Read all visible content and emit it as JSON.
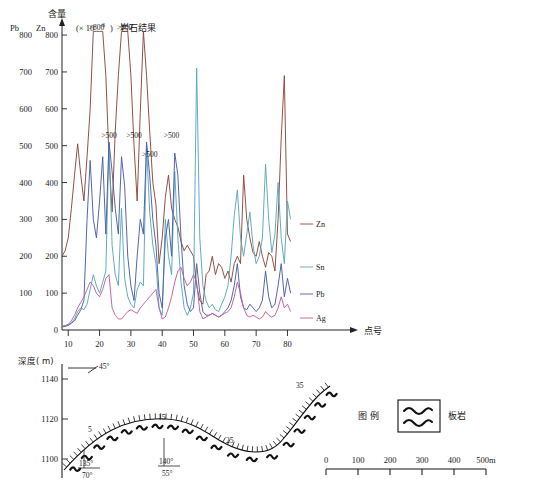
{
  "figure": {
    "top_panel": {
      "header": {
        "quantity_label": "含量",
        "unit_label": "(× 10",
        "unit_exp": "-6",
        "unit_close": ")",
        "title": "岩石结果"
      },
      "left_axis_name": "Pb",
      "right_axis_name": "Zn",
      "x_axis_label": "点号",
      "y_ticks": [
        800,
        700,
        600,
        500,
        400,
        300,
        200,
        100,
        0
      ],
      "x_ticks": [
        10,
        20,
        30,
        40,
        50,
        60,
        70,
        80
      ],
      "series_labels": [
        "Zn",
        "Sn",
        "Pb",
        "Ag"
      ],
      "annotations": [
        ">800",
        ">800",
        ">500",
        ">500",
        ">500",
        ">500"
      ],
      "colors": {
        "Zn": "#8B4A3A",
        "Sn": "#5BA8BF",
        "Pb": "#4A5FA8",
        "Ag": "#C060A0",
        "axis": "#222222"
      }
    },
    "bottom_panel": {
      "depth_axis_label": "深度( m)",
      "depth_ticks": [
        1140,
        1120,
        1100
      ],
      "dip_symbol_label": "45°",
      "station_labels": [
        "5",
        "15",
        "25",
        "35"
      ],
      "attitudes": [
        {
          "strike": "135°",
          "dip": "70°"
        },
        {
          "strike": "140°",
          "dip": "55°"
        }
      ],
      "legend": {
        "title": "图  例",
        "symbol_name": "wave-symbol",
        "item_label": "板岩"
      },
      "scalebar": {
        "ticks": [
          "0",
          "100",
          "200",
          "300",
          "400",
          "500m"
        ]
      }
    }
  },
  "chart_data": {
    "type": "line",
    "title": "岩石结果",
    "xlabel": "点号",
    "ylabel": "含量 (× 10-6)",
    "xlim": [
      8,
      84
    ],
    "ylim": [
      0,
      830
    ],
    "grid": false,
    "legend_position": "right",
    "x": [
      8,
      9,
      10,
      11,
      12,
      13,
      14,
      15,
      16,
      17,
      18,
      19,
      20,
      21,
      22,
      23,
      24,
      25,
      26,
      27,
      28,
      29,
      30,
      31,
      32,
      33,
      34,
      35,
      36,
      37,
      38,
      39,
      40,
      41,
      42,
      43,
      44,
      45,
      46,
      47,
      48,
      49,
      50,
      51,
      52,
      53,
      54,
      55,
      56,
      57,
      58,
      59,
      60,
      61,
      62,
      63,
      64,
      65,
      66,
      67,
      68,
      69,
      70,
      71,
      72,
      73,
      74,
      75,
      76,
      77,
      78,
      79,
      80,
      81
    ],
    "series": [
      {
        "name": "Zn",
        "color": "#8B4A3A",
        "values": [
          200,
          215,
          250,
          330,
          420,
          505,
          420,
          350,
          470,
          600,
          810,
          810,
          810,
          810,
          690,
          470,
          320,
          540,
          690,
          810,
          810,
          810,
          690,
          500,
          350,
          590,
          810,
          690,
          540,
          400,
          340,
          180,
          250,
          360,
          420,
          330,
          300,
          280,
          240,
          215,
          230,
          215,
          200,
          120,
          80,
          70,
          150,
          160,
          200,
          150,
          180,
          170,
          140,
          160,
          130,
          180,
          200,
          180,
          420,
          300,
          250,
          210,
          200,
          240,
          200,
          170,
          210,
          200,
          160,
          300,
          520,
          690,
          260,
          240
        ]
      },
      {
        "name": "Sn",
        "color": "#5BA8BF",
        "values": [
          10,
          12,
          15,
          20,
          30,
          50,
          60,
          55,
          70,
          110,
          150,
          120,
          100,
          130,
          160,
          510,
          230,
          150,
          120,
          330,
          140,
          90,
          70,
          60,
          110,
          130,
          120,
          500,
          320,
          230,
          180,
          60,
          40,
          300,
          200,
          150,
          430,
          250,
          130,
          60,
          40,
          60,
          100,
          710,
          250,
          120,
          80,
          60,
          70,
          55,
          50,
          70,
          90,
          120,
          200,
          310,
          380,
          250,
          200,
          260,
          320,
          230,
          180,
          200,
          250,
          450,
          300,
          210,
          260,
          400,
          250,
          180,
          350,
          300
        ]
      },
      {
        "name": "Pb",
        "color": "#4A5FA8",
        "values": [
          8,
          10,
          12,
          18,
          25,
          40,
          55,
          80,
          300,
          460,
          300,
          250,
          350,
          470,
          260,
          510,
          430,
          330,
          260,
          470,
          390,
          200,
          120,
          80,
          200,
          300,
          260,
          510,
          420,
          300,
          230,
          100,
          60,
          250,
          300,
          200,
          480,
          420,
          250,
          120,
          70,
          50,
          60,
          180,
          100,
          50,
          40,
          40,
          45,
          40,
          35,
          40,
          50,
          60,
          80,
          120,
          180,
          90,
          60,
          55,
          70,
          60,
          50,
          60,
          80,
          160,
          90,
          60,
          70,
          120,
          180,
          90,
          140,
          100
        ]
      },
      {
        "name": "Ag",
        "color": "#C060A0",
        "values": [
          10,
          12,
          15,
          25,
          40,
          60,
          75,
          90,
          110,
          130,
          120,
          100,
          90,
          110,
          140,
          150,
          60,
          40,
          30,
          30,
          40,
          50,
          55,
          50,
          45,
          60,
          70,
          80,
          90,
          100,
          110,
          60,
          30,
          35,
          60,
          90,
          130,
          160,
          170,
          140,
          120,
          130,
          150,
          130,
          50,
          30,
          35,
          40,
          45,
          40,
          35,
          40,
          45,
          50,
          60,
          90,
          130,
          100,
          60,
          40,
          35,
          40,
          35,
          30,
          35,
          50,
          40,
          35,
          40,
          60,
          90,
          60,
          70,
          50
        ]
      }
    ],
    "threshold_annotations": [
      {
        "label": ">800",
        "x": 19,
        "y": 815
      },
      {
        "label": ">800",
        "x": 28,
        "y": 815
      },
      {
        "label": ">500",
        "x": 23,
        "y": 520
      },
      {
        "label": ">500",
        "x": 31,
        "y": 520
      },
      {
        "label": ">500",
        "x": 36,
        "y": 470
      },
      {
        "label": ">500",
        "x": 43,
        "y": 520
      }
    ]
  }
}
